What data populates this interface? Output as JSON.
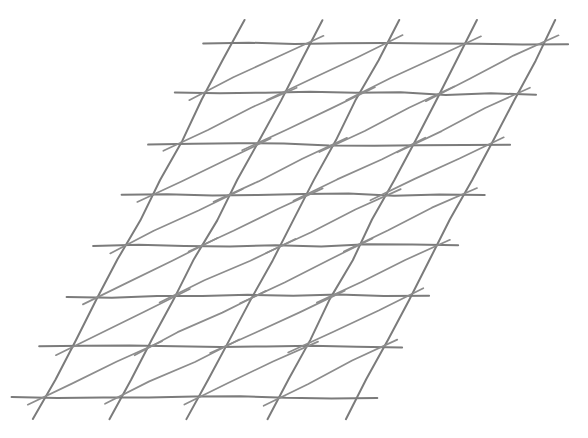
{
  "figure": {
    "kind": "line-diagram",
    "background_color": "#ffffff",
    "stroke_color": "#7b7b7b",
    "stroke_color_light": "#8d8d8d",
    "stroke_width": 2.0,
    "stroke_width_thin": 1.7,
    "width": 588,
    "height": 438
  },
  "lattice": {
    "description": "Oblique parallelogram grid: 8 horizontal rules crossed by steep down-left diagonals, with each cell cut by a shallow up-right diagonal forming triangles. All strokes overshoot past the crossings like a pencil sketch.",
    "rows": 7,
    "columns": 4,
    "horizontal_rules": 8,
    "steep_diagonals": 5,
    "shallow_diagonals": 28,
    "origin": {
      "x": 232,
      "y": 43
    },
    "column_step": {
      "x": 78,
      "y": 0
    },
    "row_step": {
      "x": -27,
      "y": 50.7
    },
    "overshoot_horizontal_start": 30,
    "overshoot_horizontal_end": 22,
    "overshoot_steep_top": 26,
    "overshoot_steep_bottom": 24,
    "overshoot_shallow_start": 16,
    "overshoot_shallow_end": 16,
    "jitter_amplitude": 1.4,
    "corner_vertices": {
      "top_left": {
        "x": 232,
        "y": 43
      },
      "top_right": {
        "x": 545,
        "y": 44
      },
      "bottom_left": {
        "x": 42,
        "y": 398
      },
      "bottom_right": {
        "x": 357,
        "y": 398
      }
    }
  },
  "chart_data": {
    "type": "line",
    "xlabel": "",
    "ylabel": "",
    "grid": true,
    "legend": "none",
    "xlim": [
      0,
      588
    ],
    "ylim": [
      438,
      0
    ],
    "series": [
      {
        "name": "horizontal-rules",
        "count": 8,
        "note": "Parallel to x-axis, stepping down-left by (-27, +50.7) per row",
        "values": [
          43,
          93.7,
          144.4,
          195.1,
          245.8,
          296.5,
          347.2,
          397.9
        ]
      },
      {
        "name": "steep-diagonals",
        "count": 5,
        "note": "From the top rule down to the bottom rule, slope dx/dy = -27/50.7",
        "values": [
          232,
          310,
          388,
          466,
          545
        ]
      },
      {
        "name": "shallow-diagonals",
        "count": 28,
        "note": "One per cell, from the cell bottom-left vertex to its top-right vertex",
        "values": [
          7,
          4
        ]
      }
    ]
  }
}
